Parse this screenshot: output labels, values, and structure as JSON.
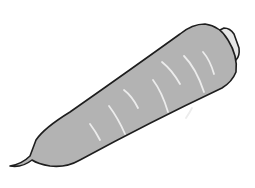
{
  "illustration": {
    "subject": "carrot",
    "colors": {
      "background": "#ffffff",
      "fill": "#b3b3b3",
      "outline": "#1e1e1e",
      "highlight": "#ececec",
      "cap_fill": "#e6e6e6"
    },
    "highlight_stroke_count": 8
  }
}
